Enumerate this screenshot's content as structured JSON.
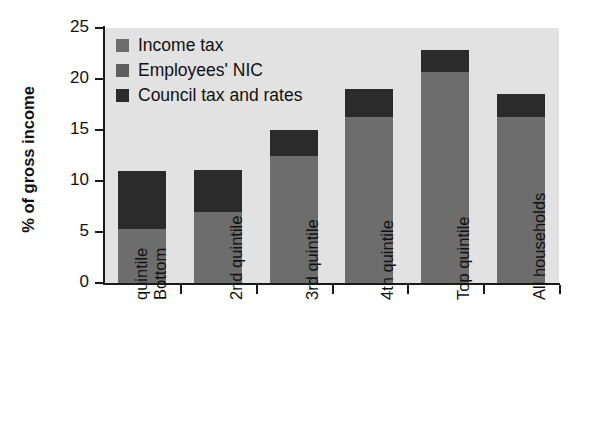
{
  "chart_data": {
    "type": "bar",
    "stacked": true,
    "title": "",
    "xlabel": "",
    "ylabel": "% of gross income",
    "ylim": [
      0,
      25
    ],
    "yticks": [
      0,
      5,
      10,
      15,
      20,
      25
    ],
    "grid": false,
    "legend_position": "top-left",
    "categories": [
      "Bottom quintile",
      "2nd quintile",
      "3rd quintile",
      "4th quintile",
      "Top quintile",
      "All households"
    ],
    "category_lines": [
      [
        "Bottom",
        "quintile"
      ],
      [
        "2nd quintile"
      ],
      [
        "3rd quintile"
      ],
      [
        "4th quintile"
      ],
      [
        "Top quintile"
      ],
      [
        "All households"
      ]
    ],
    "series": [
      {
        "name": "Income tax",
        "color": "#6d6d6d",
        "values": [
          5.3,
          7.0,
          12.5,
          16.3,
          20.7,
          16.3
        ]
      },
      {
        "name": "Employees' NIC",
        "color": "#5e5e5e",
        "values": [
          0.0,
          0.0,
          0.0,
          0.0,
          0.0,
          0.0
        ]
      },
      {
        "name": "Council tax and rates",
        "color": "#2b2b2b",
        "values": [
          5.7,
          4.1,
          2.5,
          2.7,
          2.1,
          2.2
        ]
      }
    ],
    "totals": [
      11.0,
      11.1,
      15.0,
      19.0,
      22.8,
      18.5
    ]
  },
  "legend": {
    "items": [
      {
        "label": "Income tax",
        "swatch": "income-tax-swatch"
      },
      {
        "label": "Employees' NIC",
        "swatch": "employees-nic-swatch"
      },
      {
        "label": "Council tax and rates",
        "swatch": "council-tax-swatch"
      }
    ]
  },
  "axes": {
    "y_title": "% of gross income",
    "y_tick_labels": [
      "0",
      "5",
      "10",
      "15",
      "20",
      "25"
    ]
  },
  "colors": {
    "plot_background": "#e2e2e2",
    "page_background": "#ffffff",
    "axis": "#1a1a1a",
    "income_tax": "#6d6d6d",
    "employees_nic": "#5e5e5e",
    "council_tax": "#2b2b2b",
    "text": "#111111"
  }
}
